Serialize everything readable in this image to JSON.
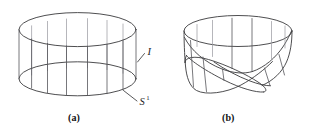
{
  "figure": {
    "background_color": "#ffffff",
    "line_color": "#3a3a3c",
    "rule_color": "#55555a",
    "hidden_rule_color": "#9d9da4"
  },
  "panels": [
    {
      "id": "a",
      "caption": "(a)",
      "name": "cylinder",
      "labels": [
        {
          "id": "fiber",
          "text": "I",
          "sup": "",
          "meaning": "interval fiber"
        },
        {
          "id": "base",
          "text": "S",
          "sup": "1",
          "meaning": "circle base"
        }
      ]
    },
    {
      "id": "b",
      "caption": "(b)",
      "name": "moebius-band",
      "labels": []
    }
  ],
  "captions": {
    "a": "(a)",
    "b": "(b)"
  },
  "labels": {
    "interval": "I",
    "circle_base": "S",
    "circle_superscript": "1"
  }
}
